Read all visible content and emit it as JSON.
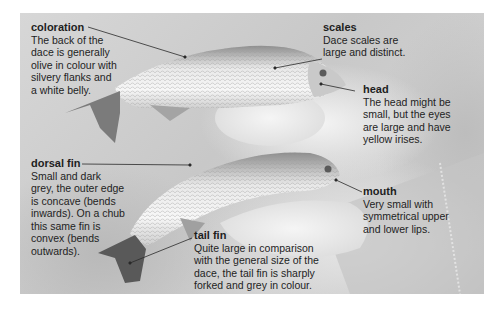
{
  "annotations": {
    "coloration": {
      "title": "coloration",
      "text": "The back of the\ndace is generally\nolive in colour with\nsilvery flanks and\na white belly."
    },
    "scales": {
      "title": "scales",
      "text": "Dace scales are\nlarge and distinct."
    },
    "head": {
      "title": "head",
      "text": "The head might be\nsmall, but the eyes\nare large and have\nyellow irises."
    },
    "dorsal_fin": {
      "title": "dorsal fin",
      "text": "Small and dark\ngrey, the outer edge\nis concave (bends\ninwards). On a chub\nthis same fin is\nconvex (bends\noutwards)."
    },
    "mouth": {
      "title": "mouth",
      "text": "Very small with\nsymmetrical upper\nand lower lips."
    },
    "tail_fin": {
      "title": "tail fin",
      "text": "Quite large in comparison\nwith the general size of the\ndace, the tail fin is sharply\nforked and grey in colour."
    }
  },
  "colors": {
    "text": "#1e1e1e",
    "leader_line": "#2a2a2a",
    "background": "#ffffff"
  }
}
